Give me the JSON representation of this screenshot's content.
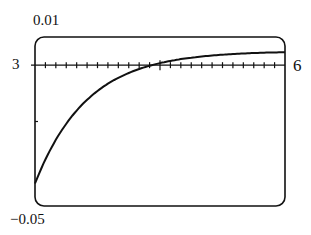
{
  "chart_data": {
    "type": "line",
    "title": "",
    "xlabel": "",
    "ylabel": "",
    "xlim": [
      0,
      6
    ],
    "ylim": [
      -0.05,
      0.01
    ],
    "x_tick_count": 24,
    "y_ticks": [
      -0.02
    ],
    "grid": false,
    "labels": {
      "ymax": "0.01",
      "ymin": "−0.05",
      "xmin": "3",
      "xmax": "6"
    },
    "series": [
      {
        "name": "curve",
        "x": [
          0,
          0.5,
          1,
          1.5,
          2,
          2.5,
          3,
          3.5,
          4,
          4.5,
          5,
          5.5,
          6
        ],
        "values": [
          -0.042,
          -0.0261,
          -0.0161,
          -0.0099,
          -0.0054,
          -0.0026,
          0.0009,
          0.0023,
          0.0031,
          0.0036,
          0.0041,
          0.0044,
          0.0046
        ]
      }
    ],
    "line_color": "#111111"
  }
}
